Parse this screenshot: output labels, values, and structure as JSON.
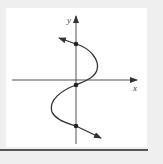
{
  "diagram": {
    "type": "graph-of-x-as-function-of-y",
    "axes": {
      "x_label": "x",
      "y_label": "y"
    },
    "points_on_y_axis": 3,
    "colors": {
      "background": "#efefef",
      "panel": "#ffffff",
      "ink": "#333333",
      "rule": "#555555"
    }
  }
}
